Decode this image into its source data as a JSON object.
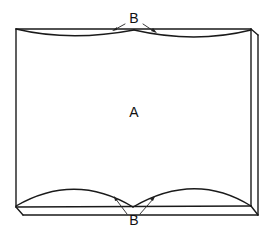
{
  "diagram": {
    "type": "schematic of a deformed slab / book-like panel with curved edges",
    "labels": {
      "center": "A",
      "top_callout": "B",
      "bottom_callout": "B"
    },
    "colors": {
      "stroke": "#1a1a1a",
      "background": "#ffffff"
    }
  }
}
